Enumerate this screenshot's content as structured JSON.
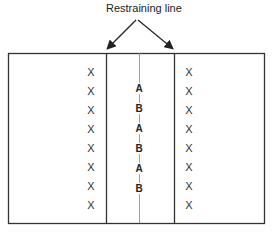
{
  "diagram": {
    "title_label": "Restraining line",
    "left_column_marker": "X",
    "right_column_marker": "X",
    "left_markers": [
      "X",
      "X",
      "X",
      "X",
      "X",
      "X",
      "X",
      "X"
    ],
    "right_markers": [
      "X",
      "X",
      "X",
      "X",
      "X",
      "X",
      "X",
      "X"
    ],
    "center_sequence": [
      "A",
      "B",
      "A",
      "B",
      "A",
      "B"
    ],
    "colors": {
      "line": "#333333",
      "center_line": "#777777",
      "text": "#222222"
    }
  }
}
